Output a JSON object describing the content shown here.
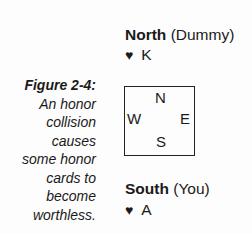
{
  "caption": {
    "title": "Figure 2-4:",
    "lines": [
      "An honor",
      "collision",
      "causes",
      "some honor",
      "cards to",
      "become",
      "worthless."
    ]
  },
  "north": {
    "name": "North",
    "role": "(Dummy)",
    "suit_icon": "♥",
    "card": "K"
  },
  "south": {
    "name": "South",
    "role": "(You)",
    "suit_icon": "♥",
    "card": "A"
  },
  "compass": {
    "n": "N",
    "e": "E",
    "s": "S",
    "w": "W"
  }
}
